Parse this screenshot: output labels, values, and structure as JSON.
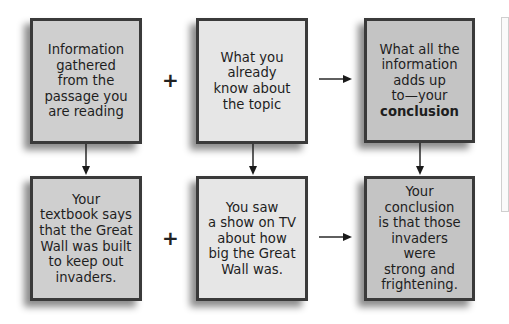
{
  "diagram": {
    "rows": [
      {
        "boxes": [
          {
            "text": "Information\ngathered\nfrom the\npassage you\nare reading",
            "fill": "#cfcfcf"
          },
          {
            "text": "What you\nalready\nknow about\nthe topic",
            "fill": "#e6e6e6"
          },
          {
            "text_prefix": "What all the\ninformation\nadds up\nto—your\n",
            "text_bold": "conclusion",
            "fill": "#c4c4c4"
          }
        ],
        "operators": [
          "+",
          "arrow-right"
        ]
      },
      {
        "boxes": [
          {
            "text": "Your\ntextbook says\nthat the Great\nWall was built\nto keep out\ninvaders.",
            "fill": "#cfcfcf"
          },
          {
            "text": "You saw\na show on TV\nabout how\nbig the Great\nWall was.",
            "fill": "#e6e6e6"
          },
          {
            "text": "Your\nconclusion\nis that those\ninvaders were\nstrong and\nfrightening.",
            "fill": "#c4c4c4"
          }
        ],
        "operators": [
          "+",
          "arrow-right"
        ]
      }
    ],
    "colors": {
      "border": "#3a3a3a",
      "text": "#1e1e1e",
      "arrow": "#1a1a1a"
    }
  }
}
